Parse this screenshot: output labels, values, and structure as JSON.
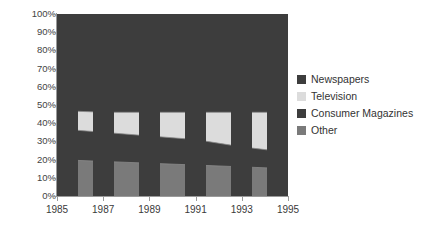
{
  "chart_data": {
    "type": "area",
    "title": "",
    "subtitle": "",
    "xlabel": "",
    "ylabel": "",
    "stacked": true,
    "normalized_percent": true,
    "grid": false,
    "legend_position": "right",
    "x": [
      1985,
      1987,
      1989,
      1991,
      1993,
      1995
    ],
    "categories": [
      "1985",
      "1987",
      "1989",
      "1991",
      "1993",
      "1995"
    ],
    "ylim": [
      0,
      100
    ],
    "yticks": [
      0,
      10,
      20,
      30,
      40,
      50,
      60,
      70,
      80,
      90,
      100
    ],
    "ytick_labels": [
      "0%",
      "10%",
      "20%",
      "30%",
      "40%",
      "50%",
      "60%",
      "70%",
      "80%",
      "90%",
      "100%"
    ],
    "series": [
      {
        "name": "Other",
        "color": "#7a7a7a",
        "values": [
          20,
          19,
          18,
          17,
          16,
          15
        ]
      },
      {
        "name": "Consumer Magazines",
        "color": "#3d3d3d",
        "values": [
          17,
          16,
          15,
          14,
          11,
          9
        ]
      },
      {
        "name": "Television",
        "color": "#dcdcdc",
        "values": [
          10,
          11,
          13,
          15,
          19,
          22
        ]
      },
      {
        "name": "Newspapers",
        "color": "#3d3d3d",
        "values": [
          53,
          54,
          54,
          54,
          54,
          54
        ]
      }
    ],
    "cumulative_boundaries": {
      "other_top": [
        20,
        19,
        18,
        17,
        16,
        15
      ],
      "consumer_magazines_top": [
        37,
        35,
        33,
        31,
        27,
        24
      ],
      "television_top": [
        47,
        46,
        46,
        46,
        46,
        46
      ],
      "newspapers_top": [
        100,
        100,
        100,
        100,
        100,
        100
      ]
    }
  },
  "legend": {
    "items": [
      {
        "label": "Newspapers",
        "color": "#3d3d3d"
      },
      {
        "label": "Television",
        "color": "#dcdcdc"
      },
      {
        "label": "Consumer Magazines",
        "color": "#3d3d3d"
      },
      {
        "label": "Other",
        "color": "#7a7a7a"
      }
    ]
  },
  "colors": {
    "axis": "#9a9a9a",
    "band": "#3d3d3d",
    "boundary_line": "#8a8a8a",
    "background": "#ffffff"
  }
}
